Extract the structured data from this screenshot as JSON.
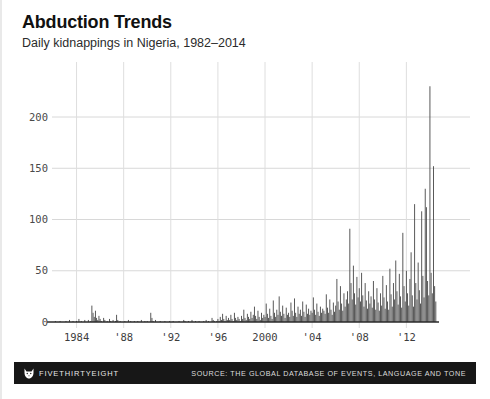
{
  "header": {
    "title": "Abduction Trends",
    "subtitle": "Daily kidnappings in Nigeria, 1982–2014"
  },
  "footer": {
    "brand": "FIVETHIRTYEIGHT",
    "logo_icon": "fox-head-icon",
    "source": "SOURCE: THE GLOBAL DATABASE OF EVENTS, LANGUAGE AND TONE"
  },
  "colors": {
    "bar": "#4b4b4b",
    "gridline": "#d8d8d8",
    "axis": "#2a2a2a",
    "footer_bg": "#171717",
    "background": "#ffffff",
    "title": "#111111"
  },
  "chart_data": {
    "type": "bar",
    "title": "Abduction Trends",
    "subtitle": "Daily kidnappings in Nigeria, 1982–2014",
    "xlabel": "",
    "ylabel": "",
    "xlim": [
      1982,
      2014.6
    ],
    "ylim": [
      0,
      235
    ],
    "grid": true,
    "legend": null,
    "ytick_labels": [
      "0",
      "50",
      "100",
      "150",
      "200"
    ],
    "ytick_values": [
      0,
      50,
      100,
      150,
      200
    ],
    "xtick_labels": [
      "1984",
      "'88",
      "'92",
      "'96",
      "2000",
      "'04",
      "'08",
      "'12"
    ],
    "xtick_values": [
      1984,
      1988,
      1992,
      1996,
      2000,
      2004,
      2008,
      2012
    ],
    "peak_value": 230,
    "peak_year": 2014.3,
    "x": [
      1982.0,
      1982.1,
      1982.2,
      1982.3,
      1982.4,
      1982.5,
      1982.6,
      1982.7,
      1982.8,
      1982.9,
      1983.0,
      1983.1,
      1983.2,
      1983.3,
      1983.4,
      1983.5,
      1983.6,
      1983.7,
      1983.8,
      1983.9,
      1984.0,
      1984.1,
      1984.2,
      1984.3,
      1984.4,
      1984.5,
      1984.6,
      1984.7,
      1984.8,
      1984.9,
      1985.0,
      1985.1,
      1985.2,
      1985.3,
      1985.4,
      1985.5,
      1985.6,
      1985.7,
      1985.8,
      1985.9,
      1986.0,
      1986.1,
      1986.2,
      1986.3,
      1986.4,
      1986.5,
      1986.6,
      1986.7,
      1986.8,
      1986.9,
      1987.0,
      1987.1,
      1987.2,
      1987.3,
      1987.4,
      1987.5,
      1987.6,
      1987.7,
      1987.8,
      1987.9,
      1988.0,
      1988.1,
      1988.2,
      1988.3,
      1988.4,
      1988.5,
      1988.6,
      1988.7,
      1988.8,
      1988.9,
      1989.0,
      1989.1,
      1989.2,
      1989.3,
      1989.4,
      1989.5,
      1989.6,
      1989.7,
      1989.8,
      1989.9,
      1990.0,
      1990.1,
      1990.2,
      1990.3,
      1990.4,
      1990.5,
      1990.6,
      1990.7,
      1990.8,
      1990.9,
      1991.0,
      1991.1,
      1991.2,
      1991.3,
      1991.4,
      1991.5,
      1991.6,
      1991.7,
      1991.8,
      1991.9,
      1992.0,
      1992.1,
      1992.2,
      1992.3,
      1992.4,
      1992.5,
      1992.6,
      1992.7,
      1992.8,
      1992.9,
      1993.0,
      1993.1,
      1993.2,
      1993.3,
      1993.4,
      1993.5,
      1993.6,
      1993.7,
      1993.8,
      1993.9,
      1994.0,
      1994.1,
      1994.2,
      1994.3,
      1994.4,
      1994.5,
      1994.6,
      1994.7,
      1994.8,
      1994.9,
      1995.0,
      1995.1,
      1995.2,
      1995.3,
      1995.4,
      1995.5,
      1995.6,
      1995.7,
      1995.8,
      1995.9,
      1996.0,
      1996.1,
      1996.2,
      1996.3,
      1996.4,
      1996.5,
      1996.6,
      1996.7,
      1996.8,
      1996.9,
      1997.0,
      1997.1,
      1997.2,
      1997.3,
      1997.4,
      1997.5,
      1997.6,
      1997.7,
      1997.8,
      1997.9,
      1998.0,
      1998.1,
      1998.2,
      1998.3,
      1998.4,
      1998.5,
      1998.6,
      1998.7,
      1998.8,
      1998.9,
      1999.0,
      1999.1,
      1999.2,
      1999.3,
      1999.4,
      1999.5,
      1999.6,
      1999.7,
      1999.8,
      1999.9,
      2000.0,
      2000.1,
      2000.2,
      2000.3,
      2000.4,
      2000.5,
      2000.6,
      2000.7,
      2000.8,
      2000.9,
      2001.0,
      2001.1,
      2001.2,
      2001.3,
      2001.4,
      2001.5,
      2001.6,
      2001.7,
      2001.8,
      2001.9,
      2002.0,
      2002.1,
      2002.2,
      2002.3,
      2002.4,
      2002.5,
      2002.6,
      2002.7,
      2002.8,
      2002.9,
      2003.0,
      2003.1,
      2003.2,
      2003.3,
      2003.4,
      2003.5,
      2003.6,
      2003.7,
      2003.8,
      2003.9,
      2004.0,
      2004.1,
      2004.2,
      2004.3,
      2004.4,
      2004.5,
      2004.6,
      2004.7,
      2004.8,
      2004.9,
      2005.0,
      2005.1,
      2005.2,
      2005.3,
      2005.4,
      2005.5,
      2005.6,
      2005.7,
      2005.8,
      2005.9,
      2006.0,
      2006.1,
      2006.2,
      2006.3,
      2006.4,
      2006.5,
      2006.6,
      2006.7,
      2006.8,
      2006.9,
      2007.0,
      2007.1,
      2007.2,
      2007.3,
      2007.4,
      2007.5,
      2007.6,
      2007.7,
      2007.8,
      2007.9,
      2008.0,
      2008.1,
      2008.2,
      2008.3,
      2008.4,
      2008.5,
      2008.6,
      2008.7,
      2008.8,
      2008.9,
      2009.0,
      2009.1,
      2009.2,
      2009.3,
      2009.4,
      2009.5,
      2009.6,
      2009.7,
      2009.8,
      2009.9,
      2010.0,
      2010.1,
      2010.2,
      2010.3,
      2010.4,
      2010.5,
      2010.6,
      2010.7,
      2010.8,
      2010.9,
      2011.0,
      2011.1,
      2011.2,
      2011.3,
      2011.4,
      2011.5,
      2011.6,
      2011.7,
      2011.8,
      2011.9,
      2012.0,
      2012.1,
      2012.2,
      2012.3,
      2012.4,
      2012.5,
      2012.6,
      2012.7,
      2012.8,
      2012.9,
      2013.0,
      2013.1,
      2013.2,
      2013.3,
      2013.4,
      2013.5,
      2013.6,
      2013.7,
      2013.8,
      2013.9,
      2014.0,
      2014.1,
      2014.2,
      2014.3,
      2014.4,
      2014.5
    ],
    "values": [
      0,
      0,
      1,
      0,
      0,
      0,
      1,
      0,
      0,
      0,
      0,
      1,
      0,
      0,
      2,
      0,
      0,
      1,
      0,
      0,
      1,
      0,
      3,
      0,
      1,
      0,
      0,
      2,
      0,
      0,
      2,
      0,
      1,
      16,
      9,
      5,
      11,
      4,
      2,
      6,
      3,
      1,
      0,
      4,
      2,
      0,
      1,
      0,
      3,
      1,
      0,
      2,
      0,
      1,
      7,
      2,
      0,
      1,
      0,
      0,
      0,
      1,
      0,
      0,
      2,
      0,
      1,
      0,
      0,
      1,
      0,
      0,
      1,
      0,
      0,
      2,
      0,
      0,
      1,
      0,
      1,
      0,
      0,
      9,
      4,
      1,
      0,
      2,
      0,
      0,
      0,
      1,
      0,
      0,
      0,
      1,
      0,
      0,
      0,
      1,
      0,
      0,
      1,
      0,
      0,
      0,
      0,
      1,
      0,
      0,
      0,
      2,
      1,
      0,
      0,
      1,
      0,
      0,
      2,
      0,
      0,
      1,
      0,
      0,
      1,
      0,
      0,
      0,
      1,
      0,
      2,
      0,
      1,
      0,
      0,
      4,
      2,
      1,
      0,
      1,
      3,
      1,
      5,
      2,
      8,
      3,
      1,
      6,
      2,
      4,
      2,
      7,
      3,
      1,
      9,
      4,
      2,
      5,
      3,
      1,
      6,
      3,
      12,
      4,
      2,
      8,
      5,
      3,
      10,
      4,
      7,
      15,
      6,
      3,
      11,
      5,
      2,
      9,
      4,
      7,
      5,
      18,
      8,
      4,
      13,
      6,
      3,
      21,
      9,
      5,
      12,
      7,
      25,
      10,
      6,
      16,
      8,
      4,
      14,
      7,
      9,
      5,
      19,
      11,
      6,
      23,
      9,
      5,
      15,
      8,
      12,
      6,
      20,
      10,
      5,
      17,
      8,
      13,
      7,
      11,
      9,
      24,
      12,
      7,
      18,
      10,
      6,
      15,
      9,
      13,
      11,
      8,
      27,
      14,
      9,
      22,
      12,
      7,
      19,
      10,
      16,
      42,
      20,
      12,
      35,
      18,
      11,
      28,
      15,
      22,
      30,
      18,
      91,
      38,
      22,
      55,
      28,
      17,
      44,
      24,
      33,
      20,
      48,
      26,
      15,
      38,
      21,
      13,
      30,
      18,
      25,
      14,
      40,
      22,
      12,
      33,
      19,
      11,
      28,
      16,
      45,
      24,
      13,
      36,
      20,
      12,
      52,
      27,
      15,
      38,
      22,
      60,
      30,
      17,
      47,
      25,
      14,
      87,
      35,
      20,
      50,
      28,
      16,
      42,
      68,
      26,
      15,
      115,
      38,
      22,
      58,
      31,
      18,
      108,
      45,
      24,
      130,
      112,
      40,
      26,
      230,
      48,
      28,
      152,
      35,
      20
    ]
  }
}
